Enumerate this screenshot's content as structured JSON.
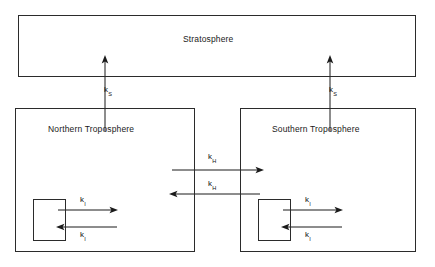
{
  "diagram": {
    "type": "box-and-arrow-compartment-model",
    "background_color": "#ffffff",
    "line_color": "#1a1a1a",
    "text_color": "#111111",
    "boxes": [
      {
        "id": "stratosphere",
        "label": "Stratosphere",
        "x": 18,
        "y": 15,
        "width": 398,
        "height": 62,
        "label_x": 183,
        "label_y": 39
      },
      {
        "id": "northern-troposphere",
        "label": "Northern Troposphere",
        "x": 15,
        "y": 108,
        "width": 180,
        "height": 144,
        "label_x": 48,
        "label_y": 129
      },
      {
        "id": "southern-troposphere",
        "label": "Southern Troposphere",
        "x": 240,
        "y": 108,
        "width": 176,
        "height": 144,
        "label_x": 272,
        "label_y": 129
      },
      {
        "id": "northern-inner-reservoir",
        "label": "",
        "x": 33,
        "y": 199,
        "width": 33,
        "height": 42,
        "label_x": 0,
        "label_y": 0
      },
      {
        "id": "southern-inner-reservoir",
        "label": "",
        "x": 258,
        "y": 199,
        "width": 33,
        "height": 42,
        "label_x": 0,
        "label_y": 0
      }
    ],
    "rate_labels": [
      {
        "id": "ks-north",
        "base": "k",
        "subscript": "S",
        "x": 108,
        "y": 86
      },
      {
        "id": "ks-south",
        "base": "k",
        "subscript": "S",
        "x": 333,
        "y": 86
      },
      {
        "id": "kh-northbound",
        "base": "k",
        "subscript": "H",
        "x": 210,
        "y": 153
      },
      {
        "id": "kh-southbound",
        "base": "k",
        "subscript": "H",
        "x": 210,
        "y": 182
      },
      {
        "id": "ki-north-out",
        "base": "k",
        "subscript": "I",
        "x": 80,
        "y": 196
      },
      {
        "id": "ki-north-in",
        "base": "k",
        "subscript": "I",
        "x": 80,
        "y": 228
      },
      {
        "id": "ki-south-out",
        "base": "k",
        "subscript": "I",
        "x": 305,
        "y": 196
      },
      {
        "id": "ki-south-in",
        "base": "k",
        "subscript": "I",
        "x": 305,
        "y": 228
      }
    ],
    "arrows": [
      {
        "id": "arrow-ks-north",
        "description": "Northern Troposphere to Stratosphere",
        "direction": "up",
        "x1": 105,
        "y1": 131,
        "x2": 105,
        "y2": 58
      },
      {
        "id": "arrow-ks-south",
        "description": "Southern Troposphere to Stratosphere",
        "direction": "up",
        "x1": 330,
        "y1": 131,
        "x2": 330,
        "y2": 58
      },
      {
        "id": "arrow-kh-northbound",
        "description": "Northern Troposphere to Southern Troposphere",
        "direction": "right",
        "x1": 172,
        "y1": 170,
        "x2": 262,
        "y2": 170
      },
      {
        "id": "arrow-kh-southbound",
        "description": "Southern Troposphere to Northern Troposphere",
        "direction": "left",
        "x1": 260,
        "y1": 194,
        "x2": 170,
        "y2": 194
      },
      {
        "id": "arrow-ki-north-out",
        "description": "Northern inner reservoir outflow",
        "direction": "right",
        "x1": 58,
        "y1": 210,
        "x2": 116,
        "y2": 210
      },
      {
        "id": "arrow-ki-north-in",
        "description": "Northern inner reservoir inflow",
        "direction": "left",
        "x1": 116,
        "y1": 227,
        "x2": 58,
        "y2": 227
      },
      {
        "id": "arrow-ki-south-out",
        "description": "Southern inner reservoir outflow",
        "direction": "right",
        "x1": 283,
        "y1": 210,
        "x2": 341,
        "y2": 210
      },
      {
        "id": "arrow-ki-south-in",
        "description": "Southern inner reservoir inflow",
        "direction": "left",
        "x1": 341,
        "y1": 227,
        "x2": 283,
        "y2": 227
      }
    ]
  }
}
